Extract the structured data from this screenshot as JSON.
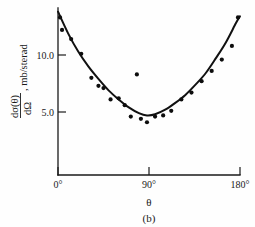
{
  "figure": {
    "caption": "(b)",
    "background_color": "#fefefe",
    "ink_color": "#111111"
  },
  "axes": {
    "y_tick_labels": [
      "10.0",
      "5.0"
    ],
    "y_tick_values": [
      10.0,
      5.0
    ],
    "x_tick_labels": [
      "0°",
      "90°",
      "180°"
    ],
    "x_tick_values": [
      0,
      90,
      180
    ],
    "x_axis_title": "θ",
    "y_axis_label_numerator": "dσ(θ)",
    "y_axis_label_denominator": "dΩ",
    "y_axis_label_units": ", mb/sterad",
    "y_axis_label_full": "dσ(θ)/dΩ, mb/sterad"
  },
  "chart_data": {
    "type": "scatter",
    "title": "",
    "subtitle": "",
    "xlabel": "θ",
    "ylabel": "dσ(θ)/dΩ, mb/sterad",
    "xlim": [
      0,
      180
    ],
    "ylim": [
      0,
      14.0
    ],
    "grid": false,
    "legend": "none",
    "xticks": [
      0,
      90,
      180
    ],
    "xticklabels": [
      "0°",
      "90°",
      "180°"
    ],
    "yticks": [
      5.0,
      10.0
    ],
    "yticklabels": [
      "5.0",
      "10.0"
    ],
    "series": [
      {
        "name": "measured cross section",
        "marker": "filled-circle",
        "x": [
          2,
          4,
          13,
          23,
          33,
          40,
          45,
          52,
          60,
          66,
          72,
          78,
          82,
          88,
          96,
          104,
          112,
          122,
          132,
          142,
          152,
          162,
          172,
          178
        ],
        "y": [
          13.3,
          12.2,
          11.4,
          10.1,
          8.0,
          7.3,
          7.1,
          6.1,
          6.2,
          5.6,
          4.6,
          8.3,
          4.4,
          4.1,
          4.6,
          4.7,
          5.1,
          6.1,
          6.7,
          7.7,
          8.6,
          9.6,
          10.8,
          13.3
        ]
      },
      {
        "name": "fitted curve",
        "marker": "none",
        "style": "solid-line",
        "x": [
          0,
          10,
          20,
          30,
          40,
          50,
          60,
          70,
          80,
          88,
          96,
          106,
          116,
          126,
          136,
          146,
          156,
          166,
          176,
          180
        ],
        "y": [
          13.8,
          11.9,
          10.3,
          9.0,
          7.9,
          6.9,
          6.1,
          5.4,
          4.9,
          4.7,
          4.8,
          5.2,
          5.8,
          6.5,
          7.4,
          8.4,
          9.7,
          11.1,
          12.8,
          13.4
        ]
      }
    ]
  }
}
